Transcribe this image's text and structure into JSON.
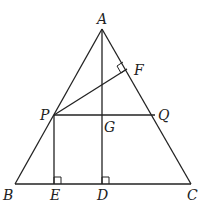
{
  "figure": {
    "points": {
      "A": {
        "label": "A",
        "x": 102,
        "y": 29
      },
      "B": {
        "label": "B",
        "x": 15,
        "y": 184
      },
      "C": {
        "label": "C",
        "x": 191,
        "y": 184
      },
      "D": {
        "label": "D",
        "x": 102,
        "y": 184
      },
      "E": {
        "label": "E",
        "x": 54,
        "y": 184
      },
      "F": {
        "label": "F",
        "x": 127,
        "y": 69
      },
      "G": {
        "label": "G",
        "x": 102,
        "y": 115
      },
      "P": {
        "label": "P",
        "x": 54,
        "y": 115
      },
      "Q": {
        "label": "Q",
        "x": 155,
        "y": 115
      }
    },
    "segments": [
      "AB",
      "AC",
      "BC",
      "AD",
      "PQ",
      "PE",
      "PF"
    ],
    "right_angles": [
      "E",
      "D",
      "F"
    ]
  }
}
